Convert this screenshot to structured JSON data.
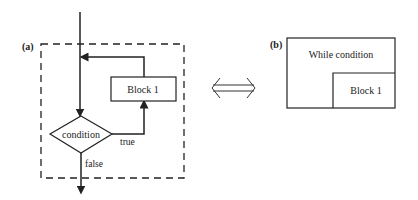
{
  "diagram": {
    "panel_a": {
      "label": "(a)",
      "block_label": "Block 1",
      "decision_label": "condition",
      "true_label": "true",
      "false_label": "false"
    },
    "equivalence_symbol": "double-arrow-icon",
    "panel_b": {
      "label": "(b)",
      "outer_label": "While condition",
      "inner_label": "Block 1"
    },
    "colors": {
      "line": "#222222",
      "background": "#ffffff"
    }
  }
}
